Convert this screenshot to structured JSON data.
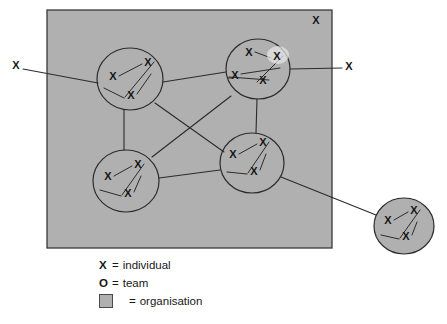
{
  "diagram": {
    "colors": {
      "organisation_fill": "#b0b0b0",
      "organisation_stroke": "#3a3a3a",
      "line": "#2b2b2b",
      "text": "#171717",
      "background": "#ffffff"
    },
    "organisation_box": {
      "x": 47,
      "y": 10,
      "width": 285,
      "height": 238
    },
    "teams": [
      {
        "id": "team-top-left",
        "label": "team",
        "cx": 130,
        "cy": 79,
        "rx": 33,
        "ry": 31,
        "filled": false,
        "members": [
          {
            "label": "X",
            "x": 113,
            "y": 77
          },
          {
            "label": "X",
            "x": 148,
            "y": 63
          },
          {
            "label": "X",
            "x": 131,
            "y": 96
          }
        ]
      },
      {
        "id": "team-top-right",
        "label": "team",
        "cx": 258,
        "cy": 69,
        "rx": 32,
        "ry": 30,
        "filled": false,
        "members": [
          {
            "label": "X",
            "x": 249,
            "y": 53
          },
          {
            "label": "X",
            "x": 277,
            "y": 57
          },
          {
            "label": "X",
            "x": 263,
            "y": 81
          },
          {
            "label": "X",
            "x": 235,
            "y": 76
          }
        ]
      },
      {
        "id": "team-bottom-left",
        "label": "team",
        "cx": 126,
        "cy": 181,
        "rx": 33,
        "ry": 31,
        "filled": false,
        "members": [
          {
            "label": "X",
            "x": 108,
            "y": 177
          },
          {
            "label": "X",
            "x": 138,
            "y": 165
          },
          {
            "label": "X",
            "x": 128,
            "y": 194
          }
        ]
      },
      {
        "id": "team-bottom-middle",
        "label": "team",
        "cx": 252,
        "cy": 163,
        "rx": 32,
        "ry": 30,
        "filled": false,
        "members": [
          {
            "label": "X",
            "x": 233,
            "y": 155
          },
          {
            "label": "X",
            "x": 263,
            "y": 143
          },
          {
            "label": "X",
            "x": 254,
            "y": 172
          }
        ]
      },
      {
        "id": "team-external",
        "label": "team",
        "cx": 404,
        "cy": 226,
        "rx": 30,
        "ry": 28,
        "filled": true,
        "members": [
          {
            "label": "X",
            "x": 388,
            "y": 221
          },
          {
            "label": "X",
            "x": 414,
            "y": 211
          },
          {
            "label": "X",
            "x": 406,
            "y": 237
          }
        ]
      }
    ],
    "loose_individuals": [
      {
        "id": "individual-left-outside",
        "label": "X",
        "x": 16,
        "y": 66
      },
      {
        "id": "individual-right-outside",
        "label": "X",
        "x": 349,
        "y": 67
      },
      {
        "id": "individual-inside-top-right",
        "label": "X",
        "x": 316,
        "y": 21
      }
    ],
    "connections": [
      {
        "id": "link-left-individual-to-top-left-team",
        "x1": 23,
        "y1": 69,
        "x2": 98,
        "y2": 83
      },
      {
        "id": "link-top-left-team-to-top-right-team",
        "x1": 163,
        "y1": 82,
        "x2": 226,
        "y2": 72
      },
      {
        "id": "link-top-right-team-to-right-individual",
        "x1": 290,
        "y1": 69,
        "x2": 342,
        "y2": 68
      },
      {
        "id": "link-top-left-team-to-bottom-left-team",
        "x1": 124,
        "y1": 110,
        "x2": 124,
        "y2": 150
      },
      {
        "id": "link-top-right-team-to-bottom-middle-team",
        "x1": 257,
        "y1": 99,
        "x2": 256,
        "y2": 133
      },
      {
        "id": "link-top-left-team-to-bottom-middle-team",
        "x1": 155,
        "y1": 103,
        "x2": 224,
        "y2": 152
      },
      {
        "id": "link-top-right-team-to-bottom-left-team",
        "x1": 231,
        "y1": 96,
        "x2": 152,
        "y2": 157
      },
      {
        "id": "link-bottom-left-team-to-bottom-middle-team",
        "x1": 159,
        "y1": 178,
        "x2": 220,
        "y2": 170
      },
      {
        "id": "link-bottom-middle-team-to-external-team",
        "x1": 281,
        "y1": 177,
        "x2": 376,
        "y2": 215
      }
    ]
  },
  "legend": {
    "rows": [
      {
        "key": "X",
        "eq": "=",
        "text": "individual",
        "swatch": false
      },
      {
        "key": "O",
        "eq": "=",
        "text": "team",
        "swatch": false
      },
      {
        "key": "",
        "eq": "=",
        "text": "organisation",
        "swatch": true
      }
    ]
  }
}
